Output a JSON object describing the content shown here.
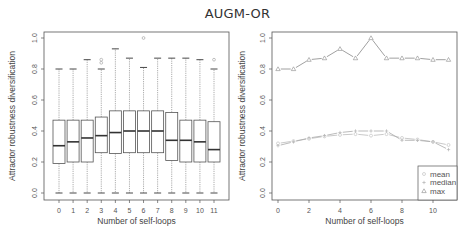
{
  "title": "AUGM-OR",
  "chart_data": [
    {
      "type": "boxplot",
      "panel": "left",
      "title": "",
      "xlabel": "Number of self-loops",
      "ylabel": "Attractor robustness diversification",
      "ylim": [
        0,
        1.0
      ],
      "yticks": [
        "0.0",
        "0.2",
        "0.4",
        "0.6",
        "0.8",
        "1.0"
      ],
      "categories": [
        "0",
        "1",
        "2",
        "3",
        "4",
        "5",
        "6",
        "7",
        "8",
        "9",
        "10",
        "11"
      ],
      "boxes": [
        {
          "x": "0",
          "whisker_low": 0.0,
          "q1": 0.19,
          "median": 0.305,
          "q3": 0.47,
          "whisker_high": 0.8,
          "outliers": []
        },
        {
          "x": "1",
          "whisker_low": 0.0,
          "q1": 0.2,
          "median": 0.33,
          "q3": 0.47,
          "whisker_high": 0.8,
          "outliers": []
        },
        {
          "x": "2",
          "whisker_low": 0.0,
          "q1": 0.2,
          "median": 0.355,
          "q3": 0.47,
          "whisker_high": 0.86,
          "outliers": []
        },
        {
          "x": "3",
          "whisker_low": 0.0,
          "q1": 0.26,
          "median": 0.37,
          "q3": 0.49,
          "whisker_high": 0.8,
          "outliers": [
            0.84,
            0.86
          ]
        },
        {
          "x": "4",
          "whisker_low": 0.0,
          "q1": 0.255,
          "median": 0.39,
          "q3": 0.53,
          "whisker_high": 0.93,
          "outliers": []
        },
        {
          "x": "5",
          "whisker_low": 0.0,
          "q1": 0.26,
          "median": 0.4,
          "q3": 0.53,
          "whisker_high": 0.87,
          "outliers": []
        },
        {
          "x": "6",
          "whisker_low": 0.0,
          "q1": 0.26,
          "median": 0.4,
          "q3": 0.53,
          "whisker_high": 0.81,
          "outliers": [
            1.0
          ]
        },
        {
          "x": "7",
          "whisker_low": 0.0,
          "q1": 0.26,
          "median": 0.4,
          "q3": 0.53,
          "whisker_high": 0.87,
          "outliers": []
        },
        {
          "x": "8",
          "whisker_low": 0.0,
          "q1": 0.21,
          "median": 0.34,
          "q3": 0.52,
          "whisker_high": 0.87,
          "outliers": []
        },
        {
          "x": "9",
          "whisker_low": 0.0,
          "q1": 0.2,
          "median": 0.34,
          "q3": 0.47,
          "whisker_high": 0.87,
          "outliers": []
        },
        {
          "x": "10",
          "whisker_low": 0.0,
          "q1": 0.2,
          "median": 0.33,
          "q3": 0.47,
          "whisker_high": 0.86,
          "outliers": []
        },
        {
          "x": "11",
          "whisker_low": 0.0,
          "q1": 0.2,
          "median": 0.28,
          "q3": 0.46,
          "whisker_high": 0.8,
          "outliers": [
            0.86
          ]
        }
      ],
      "grid": false
    },
    {
      "type": "line",
      "panel": "right",
      "title": "",
      "xlabel": "Number of self-loops",
      "ylabel": "Attractor robustness diversification",
      "ylim": [
        0,
        1.0
      ],
      "xlim": [
        0,
        11
      ],
      "xticks": [
        "0",
        "2",
        "4",
        "6",
        "8",
        "10"
      ],
      "yticks": [
        "0.0",
        "0.2",
        "0.4",
        "0.6",
        "0.8",
        "1.0"
      ],
      "x": [
        0,
        1,
        2,
        3,
        4,
        5,
        6,
        7,
        8,
        9,
        10,
        11
      ],
      "series": [
        {
          "name": "mean",
          "marker": "circle",
          "values": [
            0.32,
            0.335,
            0.35,
            0.365,
            0.375,
            0.38,
            0.37,
            0.38,
            0.355,
            0.345,
            0.33,
            0.31
          ]
        },
        {
          "name": "median",
          "marker": "plus",
          "values": [
            0.305,
            0.33,
            0.355,
            0.37,
            0.39,
            0.4,
            0.4,
            0.4,
            0.34,
            0.34,
            0.33,
            0.28
          ]
        },
        {
          "name": "max",
          "marker": "triangle",
          "values": [
            0.8,
            0.8,
            0.86,
            0.87,
            0.93,
            0.87,
            1.0,
            0.87,
            0.87,
            0.87,
            0.86,
            0.86
          ]
        }
      ],
      "legend_position": "bottom-right",
      "grid": false
    }
  ],
  "legend": {
    "items": [
      {
        "label": "mean",
        "symbol": "circle"
      },
      {
        "label": "median",
        "symbol": "plus"
      },
      {
        "label": "max",
        "symbol": "triangle"
      }
    ]
  },
  "colors": {
    "frame": "#555555",
    "box": "#555555",
    "median": "#333333",
    "whisker": "#888888",
    "line_max": "#888888",
    "line_mean": "#bbbbbb",
    "line_median": "#aaaaaa"
  }
}
